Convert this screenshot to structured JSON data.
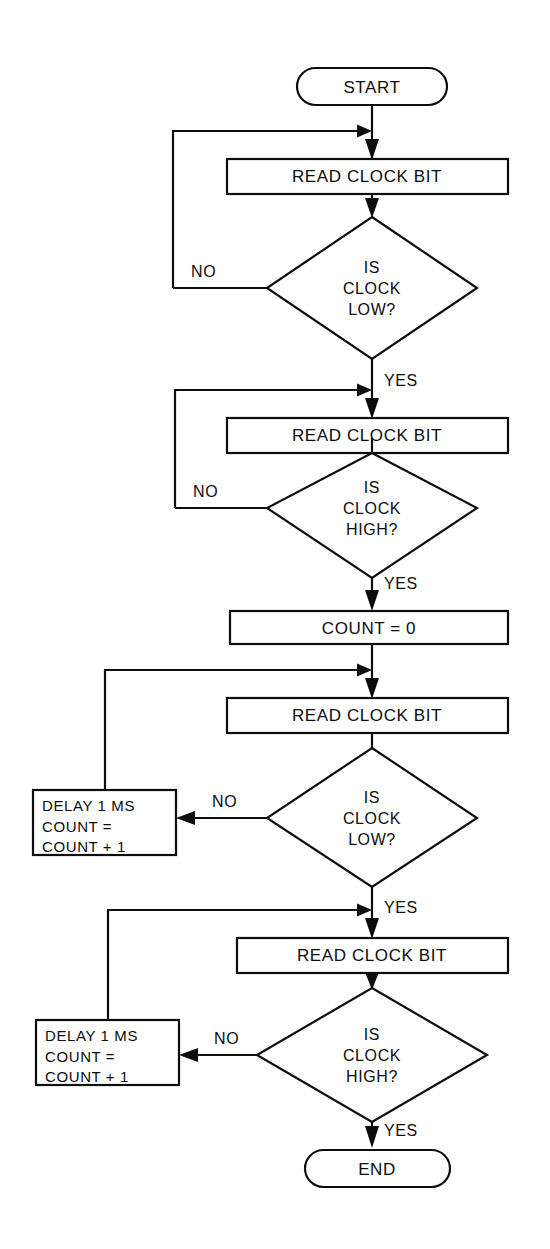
{
  "diagram": {
    "colors": {
      "ink": "#0d0d0d",
      "paper": "#ffffff"
    },
    "terminals": {
      "start": "START",
      "end": "END"
    },
    "processes": {
      "read_clock_bit_1": "READ CLOCK BIT",
      "read_clock_bit_2": "READ CLOCK BIT",
      "read_clock_bit_3": "READ CLOCK BIT",
      "read_clock_bit_4": "READ CLOCK BIT",
      "count_reset": "COUNT = 0"
    },
    "decisions": {
      "clock_low_1": {
        "line1": "IS",
        "line2": "CLOCK",
        "line3": "LOW?"
      },
      "clock_high_1": {
        "line1": "IS",
        "line2": "CLOCK",
        "line3": "HIGH?"
      },
      "clock_low_2": {
        "line1": "IS",
        "line2": "CLOCK",
        "line3": "LOW?"
      },
      "clock_high_2": {
        "line1": "IS",
        "line2": "CLOCK",
        "line3": "HIGH?"
      }
    },
    "delay_boxes": {
      "delay_1": {
        "line1": "DELAY 1 MS",
        "line2": "COUNT =",
        "line3": "COUNT + 1"
      },
      "delay_2": {
        "line1": "DELAY 1 MS",
        "line2": "COUNT =",
        "line3": "COUNT + 1"
      }
    },
    "edge_labels": {
      "no_1": "NO",
      "yes_1": "YES",
      "no_2": "NO",
      "yes_2": "YES",
      "no_3": "NO",
      "yes_3": "YES",
      "no_4": "NO",
      "yes_4": "YES"
    }
  }
}
